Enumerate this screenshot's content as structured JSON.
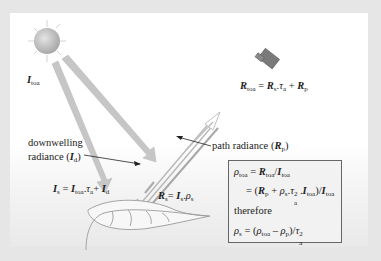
{
  "diagram": {
    "title_labels": {
      "sun_irradiance": {
        "symbol": "I",
        "sub": "toa"
      },
      "downwelling": {
        "line1": "downwelling",
        "line2_prefix": "radiance (",
        "symbol": "I",
        "sub": "d",
        "suffix": ")"
      },
      "path_radiance": {
        "prefix": "path radiance (",
        "symbol": "R",
        "sub": "p",
        "suffix": ")"
      }
    },
    "equations": {
      "r_toa": {
        "lhs": "R",
        "lhs_sub": "toa",
        "eq": " = ",
        "t1": "R",
        "t1_sub": "s",
        "dot": ".",
        "tau": "τ",
        "tau_sub": "a",
        "plus": " + ",
        "t2": "R",
        "t2_sub": "p"
      },
      "i_s": {
        "lhs": "I",
        "lhs_sub": "s",
        "eq": " = ",
        "t1": "I",
        "t1_sub": "toa",
        "dot": ".",
        "tau": "τ",
        "tau_sub": "a",
        "plus": "+ ",
        "t2": "I",
        "t2_sub": "d"
      },
      "r_s": {
        "lhs": "R",
        "lhs_sub": "s",
        "eq": "= ",
        "t1": "I",
        "t1_sub": "s",
        "dot": ".",
        "rho": "ρ",
        "rho_sub": "s"
      }
    },
    "box": {
      "line1": {
        "rho": "ρ",
        "rho_sub": "toa",
        "eq": " = ",
        "r": "R",
        "r_sub": "toa",
        "slash": "/",
        "i": "I",
        "i_sub": "toa"
      },
      "line2": {
        "eq": "= (",
        "r": "R",
        "r_sub": "p",
        "plus": " + ",
        "rho": "ρ",
        "rho_sub": "s",
        "dot": ".",
        "tau": "τ",
        "tau_sup": "2",
        "tau_sub": "a",
        "dot2": ".",
        "i": "I",
        "i_sub": "toa",
        "close": ")/",
        "i2": "I",
        "i2_sub": "toa"
      },
      "line3": "therefore",
      "line4": {
        "rho": "ρ",
        "rho_sub": "s",
        "eq": " = (",
        "rho2": "ρ",
        "rho2_sub": "toa",
        "minus": " – ",
        "rho3": "ρ",
        "rho3_sub": "p",
        "close": ")/",
        "tau": "τ",
        "tau_sup": "2",
        "tau_sub": "a"
      }
    },
    "colors": {
      "frame": "#e6e6e6",
      "panel": "#ffffff",
      "beam": "#c8c8c8",
      "satellite": "#777777",
      "box_border": "#666666"
    }
  }
}
